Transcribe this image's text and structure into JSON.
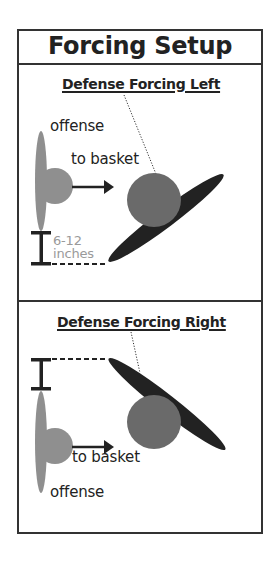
{
  "title": "Forcing Setup",
  "colors": {
    "border": "#333333",
    "offense": "#8f8f8f",
    "defense_body": "#6a6a6a",
    "defense_arm": "#222222",
    "measure_text": "#9a9a9a"
  },
  "panels": [
    {
      "heading": "Defense Forcing Left",
      "labels": {
        "offense": "offense",
        "direction": "to basket",
        "distance_line1": "6-12",
        "distance_line2": "inches"
      },
      "icons": [
        "offense-player-shape",
        "arrow-right-icon",
        "defense-player-shape",
        "defense-arm-ellipse",
        "distance-bracket-icon",
        "dotted-pointer-line"
      ]
    },
    {
      "heading": "Defense Forcing Right",
      "labels": {
        "direction": "to basket",
        "offense": "offense"
      },
      "icons": [
        "offense-player-shape",
        "arrow-right-icon",
        "defense-player-shape",
        "defense-arm-ellipse",
        "distance-bracket-icon",
        "dotted-pointer-line"
      ]
    }
  ]
}
